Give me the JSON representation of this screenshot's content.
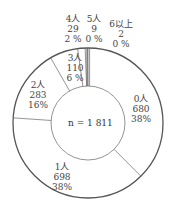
{
  "chart_data": {
    "type": "pie",
    "subtype": "donut",
    "total_label": "n = 1 811",
    "total": 1811,
    "categories": [
      "0人",
      "1人",
      "2人",
      "3人",
      "4人",
      "5人",
      "6以上"
    ],
    "values": [
      680,
      698,
      283,
      110,
      29,
      9,
      2
    ],
    "percents": [
      "38%",
      "38%",
      "16%",
      "6 %",
      "2 %",
      "0 %",
      "0 %"
    ],
    "start_angle": "top",
    "direction": "clockwise",
    "legend": "none"
  },
  "labels": [
    {
      "name": "0人",
      "count": "680",
      "pct": "38%"
    },
    {
      "name": "1人",
      "count": "698",
      "pct": "38%"
    },
    {
      "name": "2人",
      "count": "283",
      "pct": "16%"
    },
    {
      "name": "3人",
      "count": "110",
      "pct": "6 %"
    },
    {
      "name": "4人",
      "count": "29",
      "pct": "2 %"
    },
    {
      "name": "5人",
      "count": "9",
      "pct": "0 %"
    },
    {
      "name": "6以上",
      "count": "2",
      "pct": "0 %"
    }
  ],
  "colors": {
    "stroke": "#555555",
    "fill": "#ffffff"
  }
}
